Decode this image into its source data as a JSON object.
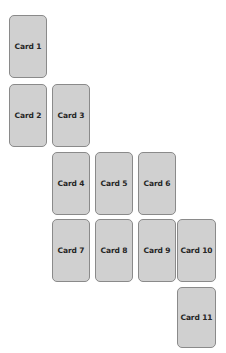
{
  "board": {
    "name": "card-staircase",
    "background_color": "#ffffff",
    "width": 226,
    "height": 353,
    "card_count": 11,
    "columns": 4,
    "rows": 5,
    "metrics": {
      "card_width": 38,
      "card_height": 63,
      "column_pitch": 43,
      "row_pitch": 68,
      "horizontal_gap": 5,
      "vertical_gap": 5,
      "corner_radius": 5
    },
    "style": {
      "card_fill": "#d0d0d0",
      "card_border": "#8a8a8a",
      "label_color": "#262626"
    }
  },
  "cards": [
    {
      "id": "card-1",
      "label": "Card 1",
      "row": 1,
      "column": 1,
      "x": 9,
      "y": 15,
      "w": 38,
      "h": 63
    },
    {
      "id": "card-2",
      "label": "Card 2",
      "row": 2,
      "column": 1,
      "x": 9,
      "y": 84,
      "w": 38,
      "h": 63
    },
    {
      "id": "card-3",
      "label": "Card 3",
      "row": 2,
      "column": 2,
      "x": 52,
      "y": 84,
      "w": 38,
      "h": 63
    },
    {
      "id": "card-4",
      "label": "Card 4",
      "row": 3,
      "column": 2,
      "x": 52,
      "y": 152,
      "w": 38,
      "h": 63
    },
    {
      "id": "card-5",
      "label": "Card 5",
      "row": 3,
      "column": 3,
      "x": 95,
      "y": 152,
      "w": 38,
      "h": 63
    },
    {
      "id": "card-6",
      "label": "Card 6",
      "row": 3,
      "column": 4,
      "x": 138,
      "y": 152,
      "w": 38,
      "h": 63
    },
    {
      "id": "card-7",
      "label": "Card 7",
      "row": 4,
      "column": 2,
      "x": 52,
      "y": 219,
      "w": 38,
      "h": 63
    },
    {
      "id": "card-8",
      "label": "Card 8",
      "row": 4,
      "column": 3,
      "x": 95,
      "y": 219,
      "w": 38,
      "h": 63
    },
    {
      "id": "card-9",
      "label": "Card 9",
      "row": 4,
      "column": 4,
      "x": 138,
      "y": 219,
      "w": 38,
      "h": 63
    },
    {
      "id": "card-10",
      "label": "Card 10",
      "row": 4,
      "column": 5,
      "x": 177,
      "y": 219,
      "w": 39,
      "h": 63
    },
    {
      "id": "card-11",
      "label": "Card 11",
      "row": 5,
      "column": 5,
      "x": 177,
      "y": 287,
      "w": 39,
      "h": 61
    }
  ]
}
